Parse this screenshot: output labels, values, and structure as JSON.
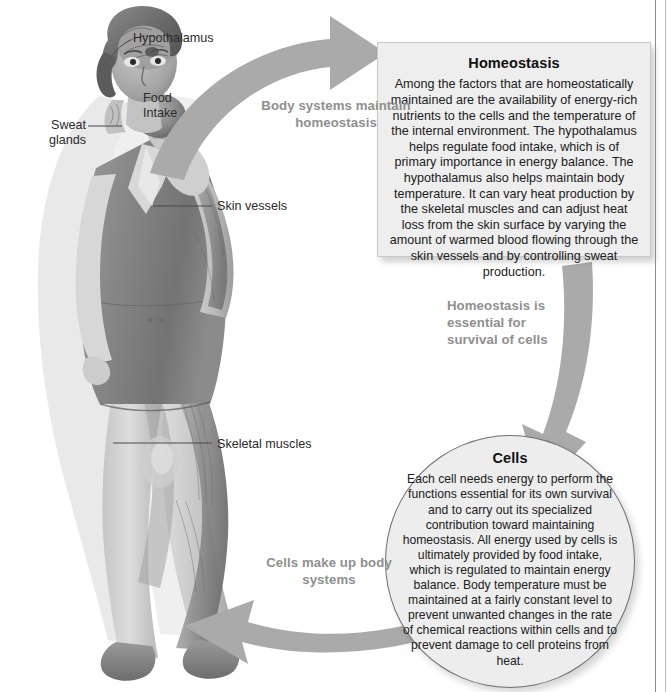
{
  "figure": {
    "colors": {
      "arrow": "#aaaaaa",
      "box_fill": "#eeeeee",
      "box_border": "#c9c9c9",
      "oval_fill": "#ededed",
      "oval_border": "#6f6f6f",
      "caption_text": "#8f8f8f",
      "body_text": "#1d1d1d",
      "page_rule": "#8d8d8d"
    }
  },
  "homeostasis_box": {
    "title": "Homeostasis",
    "body": "Among the factors that are homeostatically maintained are the availability of energy-rich nutrients to the cells and the temperature of the internal environment. The hypothalamus helps regulate food intake, which is of primary importance in energy balance. The hypothalamus also helps maintain body temperature. It can vary heat production by the skeletal muscles and can adjust heat loss from the skin surface by varying the amount of warmed blood flowing through the skin vessels and by controlling sweat production."
  },
  "cells_oval": {
    "title": "Cells",
    "body": "Each cell needs energy to perform the functions essential for its own survival and to carry out its specialized contribution toward maintaining homeostasis. All energy used by cells is ultimately provided by food intake, which is regulated to maintain energy balance. Body temperature must be maintained at a fairly constant level to prevent unwanted changes in the rate of chemical reactions within cells and to prevent damage to cell proteins from heat."
  },
  "arrows": [
    {
      "id": "arrow-body-systems",
      "caption": "Body systems\nmaintain homeostasis",
      "direction": "curve-right-up",
      "from": "body",
      "to": "homeostasis"
    },
    {
      "id": "arrow-homeostasis-essential",
      "caption": "Homeostasis is\nessential for\nsurvival of cells",
      "direction": "curve-down",
      "from": "homeostasis",
      "to": "cells"
    },
    {
      "id": "arrow-cells-make-up",
      "caption": "Cells make up\nbody systems",
      "direction": "curve-left",
      "from": "cells",
      "to": "body"
    }
  ],
  "anatomy_labels": [
    {
      "id": "hypothalamus",
      "text": "Hypothalamus"
    },
    {
      "id": "food-intake",
      "text": "Food\nIntake"
    },
    {
      "id": "sweat-glands",
      "text": "Sweat\nglands"
    },
    {
      "id": "skin-vessels",
      "text": "Skin vessels"
    },
    {
      "id": "skeletal-muscles",
      "text": "Skeletal muscles"
    }
  ],
  "illustration": {
    "subject": "standing woman eating an apple, skin partly cut away to show skeletal muscles and skin vessels"
  }
}
